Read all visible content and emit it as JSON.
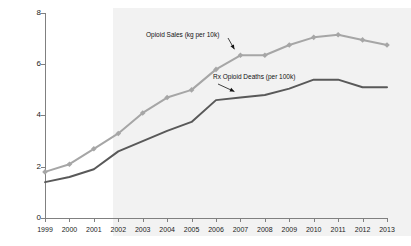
{
  "chart_data": {
    "type": "line",
    "title": "",
    "subtitle": "",
    "xlabel": "",
    "ylabel": "",
    "categories": [
      "1999",
      "2000",
      "2001",
      "2002",
      "2003",
      "2004",
      "2005",
      "2006",
      "2007",
      "2008",
      "2009",
      "2010",
      "2011",
      "2012",
      "2013"
    ],
    "x": [
      1999,
      2000,
      2001,
      2002,
      2003,
      2004,
      2005,
      2006,
      2007,
      2008,
      2009,
      2010,
      2011,
      2012,
      2013
    ],
    "ylim": [
      0,
      8
    ],
    "yticks": [
      0,
      2,
      4,
      6,
      8
    ],
    "ytick_labels": [
      "0",
      "2",
      "4",
      "6",
      "8"
    ],
    "grid": false,
    "legend": "inline-annotations",
    "series": [
      {
        "name": "Opioid Sales (kg per 10k)",
        "color": "#a6a6a6",
        "marker": "diamond",
        "values": [
          1.8,
          2.1,
          2.7,
          3.3,
          4.1,
          4.7,
          5.0,
          5.8,
          6.35,
          6.35,
          6.75,
          7.05,
          7.15,
          6.95,
          6.75
        ]
      },
      {
        "name": "Rx Opioid Deaths (per 100k)",
        "color": "#595959",
        "marker": "none",
        "values": [
          1.4,
          1.6,
          1.9,
          2.6,
          3.0,
          3.4,
          3.75,
          4.6,
          4.7,
          4.8,
          5.05,
          5.4,
          5.4,
          5.1,
          5.1
        ]
      }
    ],
    "annotations": [
      {
        "text": "Opioid Sales (kg per 10k)",
        "target_x": 2007,
        "target_y": 6.35
      },
      {
        "text": "Rx Opioid Deaths (per 100k)",
        "target_x": 2007,
        "target_y": 4.7
      }
    ],
    "shaded_region": {
      "from": "2002",
      "to": "2013",
      "color": "#f2f2f2"
    }
  }
}
